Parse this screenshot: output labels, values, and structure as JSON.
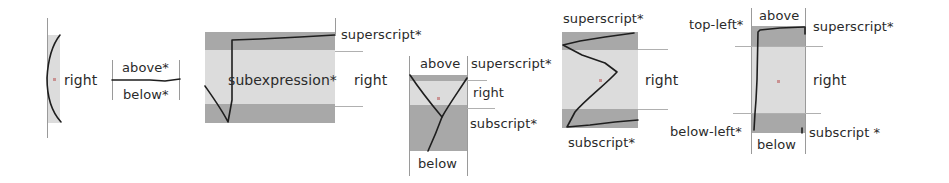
{
  "figure": {
    "panels": [
      {
        "id": "bracket",
        "labels": {
          "right": "right"
        }
      },
      {
        "id": "fraction-line",
        "labels": {
          "above": "above*",
          "below": "below*"
        }
      },
      {
        "id": "radical",
        "labels": {
          "inside": "subexpression*",
          "superscript": "superscript*",
          "right": "right"
        }
      },
      {
        "id": "sigma-like-y",
        "labels": {
          "above": "above",
          "superscript": "superscript*",
          "right": "right",
          "subscript": "subscript*",
          "below": "below"
        }
      },
      {
        "id": "zigzag",
        "labels": {
          "superscript": "superscript*",
          "right": "right",
          "subscript": "subscript*"
        }
      },
      {
        "id": "integral-box",
        "labels": {
          "top_left": "top-left*",
          "above": "above",
          "superscript": "superscript*",
          "right": "right",
          "below_left": "below-left*",
          "below": "below",
          "subscript": "subscript *"
        }
      }
    ],
    "colors": {
      "dark_band": "#a8a8a8",
      "light_band": "#dcdcdc",
      "stroke": "#1e1e1e",
      "guide_line": "#9a9a9a",
      "text": "#2a2a2a"
    }
  }
}
